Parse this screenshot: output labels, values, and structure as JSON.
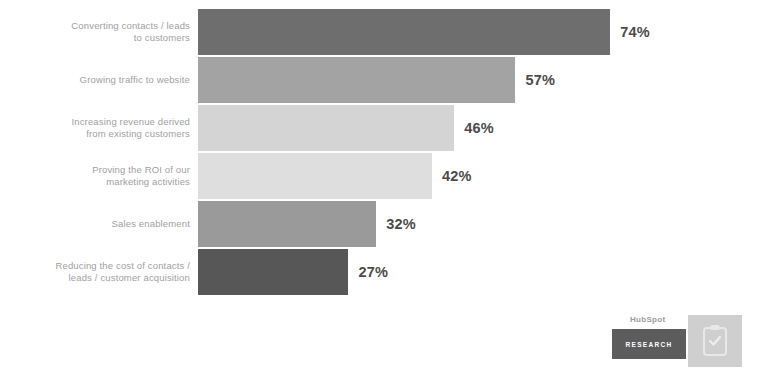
{
  "chart_data": {
    "type": "bar",
    "orientation": "horizontal",
    "title": "",
    "subtitle": "",
    "xlabel": "",
    "ylabel": "",
    "xlim": [
      0,
      100
    ],
    "grid": false,
    "legend": null,
    "value_suffix": "%",
    "categories": [
      "Converting contacts / leads\nto customers",
      "Growing traffic to website",
      "Increasing revenue derived\nfrom existing customers",
      "Proving the ROI of our\nmarketing activities",
      "Sales enablement",
      "Reducing the cost of contacts /\nleads / customer acquisition"
    ],
    "values": [
      74,
      57,
      46,
      42,
      32,
      27
    ],
    "value_labels": [
      "74%",
      "57%",
      "46%",
      "42%",
      "32%",
      "27%"
    ],
    "bar_colors": [
      "#6e6e6e",
      "#a3a3a3",
      "#d4d4d4",
      "#dedede",
      "#9a9a9a",
      "#575757"
    ],
    "label_color": "#a0a0a0",
    "value_color": "#4b4b4b",
    "background": "#ffffff"
  },
  "logo": {
    "wordmark": "HubSpot",
    "badge_label": "RESEARCH",
    "icon_name": "clipboard-icon",
    "badge_color": "#5c5c5c",
    "tile_color": "#cfcfcf"
  }
}
